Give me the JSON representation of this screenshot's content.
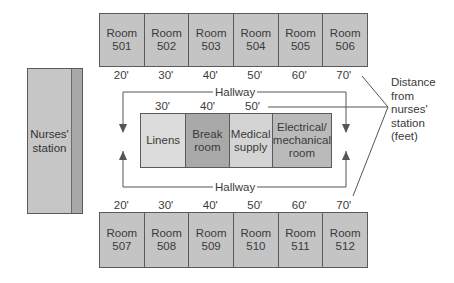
{
  "colors": {
    "room_fill": "#c4c4c4",
    "border": "#5a5a5a",
    "linens": "#dcdcdc",
    "break_room": "#a9a9a9",
    "medical_supply": "#d4d4d4",
    "electrical_room": "#bababa",
    "nurses_station": "#c6c6c6",
    "nurses_strip": "#a8a8a8"
  },
  "nurses_station": {
    "line1": "Nurses'",
    "line2": "station"
  },
  "top_rooms": [
    {
      "line1": "Room",
      "line2": "501"
    },
    {
      "line1": "Room",
      "line2": "502"
    },
    {
      "line1": "Room",
      "line2": "503"
    },
    {
      "line1": "Room",
      "line2": "504"
    },
    {
      "line1": "Room",
      "line2": "505"
    },
    {
      "line1": "Room",
      "line2": "506"
    }
  ],
  "top_distances": [
    "20'",
    "30'",
    "40'",
    "50'",
    "60'",
    "70'"
  ],
  "bottom_rooms": [
    {
      "line1": "Room",
      "line2": "507"
    },
    {
      "line1": "Room",
      "line2": "508"
    },
    {
      "line1": "Room",
      "line2": "509"
    },
    {
      "line1": "Room",
      "line2": "510"
    },
    {
      "line1": "Room",
      "line2": "511"
    },
    {
      "line1": "Room",
      "line2": "512"
    }
  ],
  "bottom_distances": [
    "20'",
    "30'",
    "40'",
    "50'",
    "60'",
    "70'"
  ],
  "inner_rooms": [
    {
      "line1": "Linens",
      "line2": "",
      "line3": ""
    },
    {
      "line1": "Break",
      "line2": "room",
      "line3": ""
    },
    {
      "line1": "Medical",
      "line2": "supply",
      "line3": ""
    },
    {
      "line1": "Electrical/",
      "line2": "mechanical",
      "line3": "room"
    }
  ],
  "inner_distances": [
    "30'",
    "40'",
    "50'"
  ],
  "hallway": {
    "top": "Hallway",
    "bottom": "Hallway"
  },
  "annotation": {
    "line1": "Distance",
    "line2": "from",
    "line3": "nurses'",
    "line4": "station",
    "line5": "(feet)"
  }
}
